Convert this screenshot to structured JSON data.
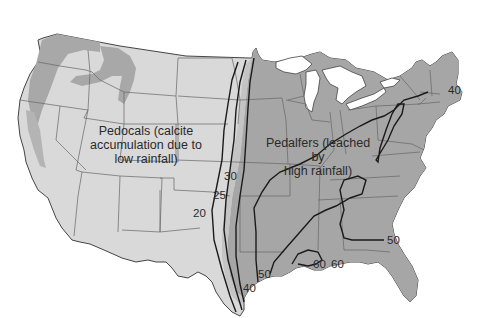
{
  "map": {
    "subject": "Soil types of the contiguous United States with annual rainfall isohyets (inches)",
    "regions": [
      {
        "name": "Pedocals",
        "label_line1": "Pedocals (calcite",
        "label_line2": "accumulation due to",
        "label_line3": "low rainfall)",
        "color": "#d9d9d9"
      },
      {
        "name": "Pedalfers",
        "label_line1": "Pedalfers (leached by",
        "label_line2": "high rainfall)",
        "color": "#a6a6a6"
      }
    ],
    "isohyet_labels": {
      "v20": "20",
      "v25": "25",
      "v30": "30",
      "v40_south": "40",
      "v40_northeast": "40",
      "v50_gulf": "50",
      "v50_atlantic": "50",
      "v60_a": "60",
      "v60_b": "60"
    },
    "colors": {
      "background": "#ffffff",
      "pedocal_fill": "#d9d9d9",
      "pedalfer_fill": "#a6a6a6",
      "mountain_patch": "#a8a8a8",
      "state_border": "#555555",
      "isohyet_line": "#1a1a1a",
      "lakes": "#ffffff"
    }
  }
}
